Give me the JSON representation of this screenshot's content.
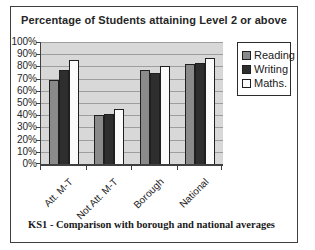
{
  "frame": {
    "border_color": "#3f3f3f",
    "background": "#ffffff"
  },
  "caption": "KS1 - Comparison with borough and national averages",
  "chart_data": {
    "type": "bar",
    "title": "Percentage of Students attaining Level 2 or above",
    "categories": [
      "Att. M-T",
      "Not Att. M-T",
      "Borough",
      "National"
    ],
    "series": [
      {
        "name": "Reading",
        "color": "#8a8a8a",
        "values": [
          69,
          40,
          77,
          82
        ]
      },
      {
        "name": "Writing",
        "color": "#2e2e2e",
        "values": [
          77,
          41,
          75,
          83
        ]
      },
      {
        "name": "Maths.",
        "color": "#fbfbfb",
        "values": [
          85,
          45,
          80,
          87
        ]
      }
    ],
    "xlabel": "",
    "ylabel": "",
    "ylim": [
      0,
      100
    ],
    "ytick_step": 10,
    "ytick_labels": [
      "100%",
      "90%",
      "80%",
      "70%",
      "60%",
      "50%",
      "40%",
      "30%",
      "20%",
      "10%",
      "0%"
    ],
    "grid": true,
    "grid_color": "#9e9e9e",
    "plot_background": "#d8d8d8",
    "bar_border_color": "#1f1f1f",
    "legend_position": "top-right"
  }
}
